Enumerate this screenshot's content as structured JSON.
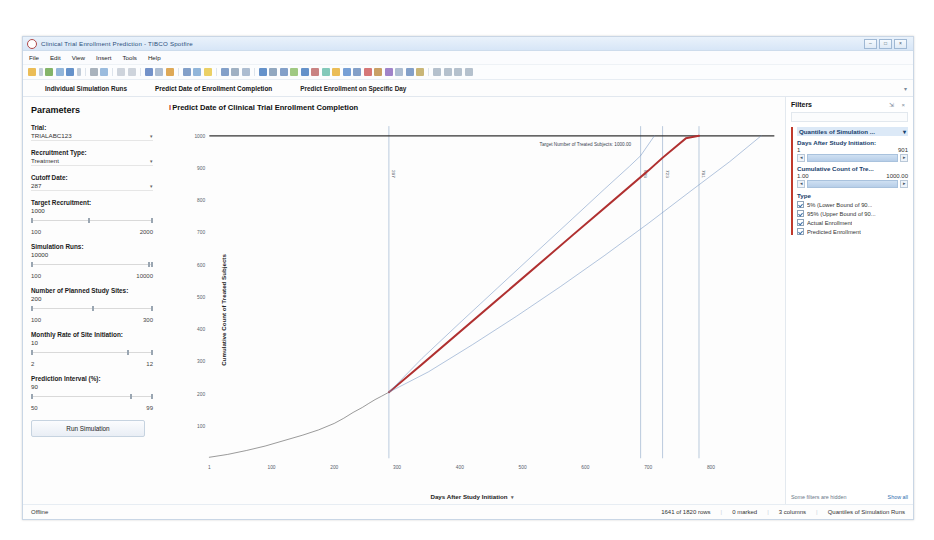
{
  "window": {
    "title": "Clinical Trial Enrollment Prediction - TIBCO Spotfire",
    "app_icon": "spotfire-icon",
    "minimize": "–",
    "maximize": "□",
    "close": "×"
  },
  "menu": [
    "File",
    "Edit",
    "View",
    "Insert",
    "Tools",
    "Help"
  ],
  "tabs": [
    {
      "label": "Individual Simulation Runs",
      "selected": false
    },
    {
      "label": "Predict Date of Enrollment Completion",
      "selected": true
    },
    {
      "label": "Predict Enrollment on Specific Day",
      "selected": false
    }
  ],
  "tab_overflow_caret": "▾",
  "parameters": {
    "heading": "Parameters",
    "trial": {
      "label": "Trial:",
      "value": "TRIALABC123",
      "caret": "▾"
    },
    "recruitment_type": {
      "label": "Recruitment Type:",
      "value": "Treatment",
      "caret": "▾"
    },
    "cutoff_date": {
      "label": "Cutoff Date:",
      "value": "287",
      "caret": "▾"
    },
    "sliders": [
      {
        "label": "Target Recruitment:",
        "value": "1000",
        "min": "100",
        "max": "2000",
        "pct": 47
      },
      {
        "label": "Simulation Runs:",
        "value": "10000",
        "min": "100",
        "max": "10000",
        "pct": 96
      },
      {
        "label": "Number of Planned Study Sites:",
        "value": "200",
        "min": "100",
        "max": "300",
        "pct": 50
      },
      {
        "label": "Monthly Rate of Site Initiation:",
        "value": "10",
        "min": "2",
        "max": "12",
        "pct": 79
      },
      {
        "label": "Prediction Interval (%):",
        "value": "90",
        "min": "50",
        "max": "99",
        "pct": 81
      }
    ],
    "run_button": "Run Simulation"
  },
  "chart_data": {
    "type": "line",
    "title": "Predict Date of Clinical Trial Enrollment Completion",
    "title_marker": "I",
    "xlabel": "Days After Study Initiation",
    "ylabel": "Cumulative Count of Treated Subjects",
    "xlabel_caret": "▾",
    "ylabel_caret": "▾",
    "xlim": [
      1,
      901
    ],
    "ylim": [
      0,
      1030
    ],
    "xticks": [
      "1",
      "100",
      "200",
      "300",
      "400",
      "500",
      "600",
      "700",
      "800"
    ],
    "xtick_values": [
      1,
      100,
      200,
      300,
      400,
      500,
      600,
      700,
      800
    ],
    "yticks": [
      "100",
      "200",
      "300",
      "400",
      "500",
      "600",
      "700",
      "800",
      "900",
      "1000"
    ],
    "ytick_values": [
      100,
      200,
      300,
      400,
      500,
      600,
      700,
      800,
      900,
      1000
    ],
    "grid": false,
    "annotation": {
      "text": "Target Number of Treated Subjects: 1000.00",
      "y": 1000,
      "x": 600
    },
    "reference_lines": [
      {
        "x": 287,
        "label": "287",
        "color": "#8fa9c8"
      },
      {
        "x": 688,
        "label": "688",
        "color": "#8fa9c8"
      },
      {
        "x": 723,
        "label": "723",
        "color": "#8fa9c8"
      },
      {
        "x": 781,
        "label": "781",
        "color": "#8fa9c8"
      }
    ],
    "series": [
      {
        "name": "Actual Enrollment",
        "color": "#5a5a5a",
        "width": 0.7,
        "points": [
          [
            1,
            3
          ],
          [
            30,
            12
          ],
          [
            60,
            24
          ],
          [
            90,
            38
          ],
          [
            120,
            55
          ],
          [
            150,
            72
          ],
          [
            175,
            88
          ],
          [
            200,
            108
          ],
          [
            215,
            124
          ],
          [
            230,
            142
          ],
          [
            245,
            158
          ],
          [
            255,
            170
          ],
          [
            265,
            182
          ],
          [
            275,
            192
          ],
          [
            287,
            205
          ]
        ]
      },
      {
        "name": "Predicted Enrollment",
        "color": "#b03030",
        "width": 2.2,
        "points": [
          [
            287,
            205
          ],
          [
            340,
            292
          ],
          [
            400,
            392
          ],
          [
            460,
            492
          ],
          [
            520,
            592
          ],
          [
            580,
            692
          ],
          [
            640,
            792
          ],
          [
            700,
            892
          ],
          [
            723,
            932
          ],
          [
            760,
            992
          ],
          [
            781,
            1000
          ]
        ]
      },
      {
        "name": "5% (Lower Bound of 90% Prediction Interval)",
        "color": "#6d8fbf",
        "width": 0.6,
        "points": [
          [
            287,
            205
          ],
          [
            350,
            268
          ],
          [
            420,
            352
          ],
          [
            490,
            440
          ],
          [
            560,
            532
          ],
          [
            630,
            628
          ],
          [
            700,
            728
          ],
          [
            770,
            832
          ],
          [
            830,
            920
          ],
          [
            880,
            1000
          ]
        ]
      },
      {
        "name": "95% (Upper Bound of 90% Prediction Interval)",
        "color": "#6d8fbf",
        "width": 0.6,
        "points": [
          [
            287,
            205
          ],
          [
            340,
            310
          ],
          [
            400,
            420
          ],
          [
            460,
            528
          ],
          [
            520,
            636
          ],
          [
            580,
            744
          ],
          [
            630,
            834
          ],
          [
            670,
            905
          ],
          [
            688,
            938
          ],
          [
            710,
            1000
          ]
        ]
      }
    ],
    "legend_position": "none"
  },
  "filters": {
    "heading": "Filters",
    "header_icons": "⇲ ×",
    "search_placeholder": "",
    "group_title": "Quantiles of Simulation ...",
    "group_caret": "▾",
    "fields": [
      {
        "label": "Days After Study Initiation:",
        "min": "1",
        "max": "901",
        "left_btn": "◂",
        "right_btn": "▸"
      },
      {
        "label": "Cumulative Count of Tre...",
        "min": "1.00",
        "max": "1000.00",
        "left_btn": "◂",
        "right_btn": "▸"
      }
    ],
    "type_label": "Type",
    "type_items": [
      {
        "label": "5% (Lower Bound of 90...",
        "checked": true
      },
      {
        "label": "95% (Upper Bound of 90...",
        "checked": true
      },
      {
        "label": "Actual Enrollment",
        "checked": true
      },
      {
        "label": "Predicted Enrollment",
        "checked": true
      }
    ],
    "hidden_note": "Some filters are hidden",
    "show_all": "Show all"
  },
  "statusbar": {
    "connection": "Offline",
    "rows": "1641 of 1820 rows",
    "marked": "0 marked",
    "columns": "3 columns",
    "source": "Quantiles of Simulation Runs",
    "sep": "|"
  },
  "colors": {
    "accent_red": "#c0392b",
    "predicted": "#b03030",
    "bounds": "#6d8fbf",
    "actual": "#5a5a5a",
    "filter_header": "#dce9f7"
  }
}
